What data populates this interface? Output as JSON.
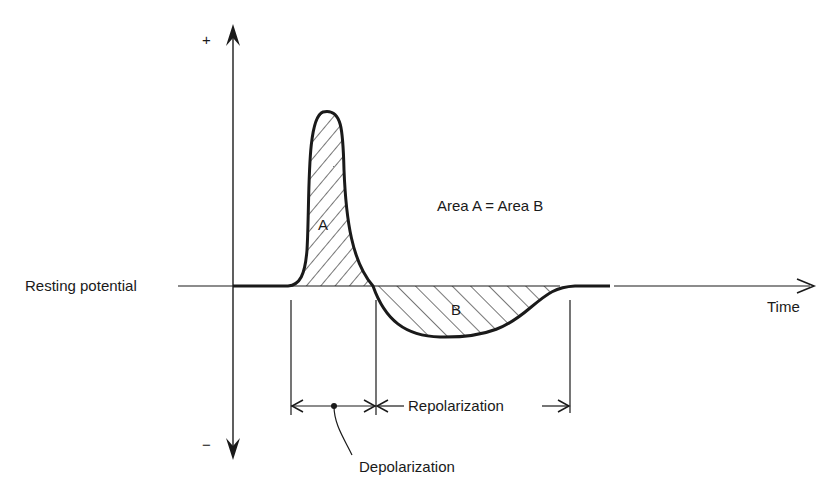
{
  "diagram": {
    "axis": {
      "y_positive_label": "+",
      "y_negative_label": "−",
      "x_label": "Time",
      "baseline_label": "Resting potential"
    },
    "regions": {
      "a_label": "A",
      "b_label": "B",
      "equation": "Area A = Area B"
    },
    "intervals": {
      "depolarization": "Depolarization",
      "repolarization": "Repolarization"
    },
    "colors": {
      "ink": "#1a1a1a",
      "background": "#ffffff"
    }
  }
}
